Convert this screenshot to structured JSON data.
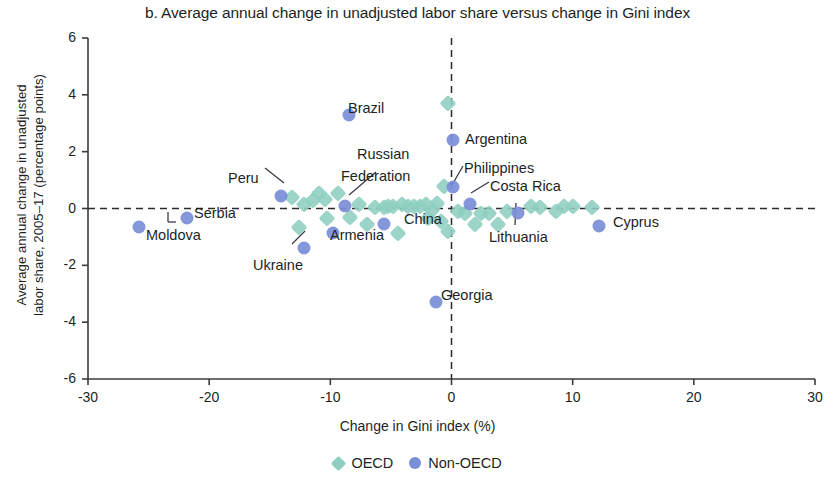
{
  "chart_data": {
    "type": "scatter",
    "title": "b. Average annual change in unadjusted labor share versus change in Gini index",
    "xlabel": "Change in Gini index (%)",
    "ylabel": "Average annual change in unadjusted labor share, 2005–17 (percentage points)",
    "ylabel_line1": "Average annual change in unadjusted",
    "ylabel_line2": "labor share, 2005–17 (percentage points)",
    "xlim": [
      -30,
      30
    ],
    "ylim": [
      -6,
      6
    ],
    "xticks": [
      "-30",
      "-20",
      "-10",
      "0",
      "10",
      "20",
      "30"
    ],
    "xtick_values": [
      -30,
      -20,
      -10,
      0,
      10,
      20,
      30
    ],
    "yticks": [
      "6",
      "4",
      "2",
      "0",
      "-2",
      "-4",
      "-6"
    ],
    "ytick_values": [
      6,
      4,
      2,
      0,
      -2,
      -4,
      -6
    ],
    "grid": false,
    "reference_lines": [
      {
        "axis": "y",
        "value": 0,
        "style": "dashed"
      },
      {
        "axis": "x",
        "value": 0,
        "style": "dashed"
      }
    ],
    "legend_position": "bottom-center",
    "colors": {
      "oecd": "#8ecfc0",
      "non_oecd": "#7b8ed8",
      "axis": "#3b3b3b",
      "text": "#221f1f"
    },
    "series": [
      {
        "name": "OECD",
        "marker": "diamond",
        "color": "#8ecfc0",
        "points": [
          {
            "x": -13.2,
            "y": 0.4
          },
          {
            "x": -12.2,
            "y": 0.15
          },
          {
            "x": -12.6,
            "y": -0.65
          },
          {
            "x": -11.4,
            "y": 0.3
          },
          {
            "x": -10.9,
            "y": 0.55
          },
          {
            "x": -10.4,
            "y": 0.35
          },
          {
            "x": -10.3,
            "y": -0.35
          },
          {
            "x": -9.4,
            "y": 0.55
          },
          {
            "x": -8.4,
            "y": -0.3
          },
          {
            "x": -7.6,
            "y": 0.15
          },
          {
            "x": -7.0,
            "y": -0.55
          },
          {
            "x": -6.3,
            "y": 0.05
          },
          {
            "x": -5.6,
            "y": 0.05
          },
          {
            "x": -5.2,
            "y": 0.1
          },
          {
            "x": -4.8,
            "y": 0.1
          },
          {
            "x": -4.4,
            "y": -0.85
          },
          {
            "x": -4.1,
            "y": 0.15
          },
          {
            "x": -3.6,
            "y": 0.1
          },
          {
            "x": -3.1,
            "y": 0.1
          },
          {
            "x": -2.6,
            "y": 0.1
          },
          {
            "x": -2.1,
            "y": 0.15
          },
          {
            "x": -1.6,
            "y": -0.05
          },
          {
            "x": -1.2,
            "y": 0.2
          },
          {
            "x": -0.9,
            "y": -0.45
          },
          {
            "x": -0.6,
            "y": 0.8
          },
          {
            "x": -0.3,
            "y": 3.7
          },
          {
            "x": -0.3,
            "y": -0.8
          },
          {
            "x": -1.9,
            "y": -0.35
          },
          {
            "x": 0.5,
            "y": -0.1
          },
          {
            "x": 1.1,
            "y": -0.15
          },
          {
            "x": 1.9,
            "y": -0.55
          },
          {
            "x": 2.4,
            "y": -0.15
          },
          {
            "x": 3.1,
            "y": -0.15
          },
          {
            "x": 3.8,
            "y": -0.55
          },
          {
            "x": 4.6,
            "y": -0.1
          },
          {
            "x": 6.6,
            "y": 0.1
          },
          {
            "x": 7.3,
            "y": 0.05
          },
          {
            "x": 8.6,
            "y": -0.1
          },
          {
            "x": 9.3,
            "y": 0.1
          },
          {
            "x": 10.0,
            "y": 0.1
          },
          {
            "x": 11.6,
            "y": 0.05
          }
        ]
      },
      {
        "name": "Non-OECD",
        "marker": "circle",
        "color": "#7b8ed8",
        "points": [
          {
            "x": -25.8,
            "y": -0.65,
            "label": "Moldova"
          },
          {
            "x": -21.8,
            "y": -0.35,
            "label": "Serbia"
          },
          {
            "x": -14.1,
            "y": 0.45,
            "label": "Peru"
          },
          {
            "x": -12.2,
            "y": -1.4,
            "label": "Ukraine"
          },
          {
            "x": -9.8,
            "y": -0.85,
            "label": "Armenia"
          },
          {
            "x": -8.8,
            "y": 0.1,
            "label": "Russian Federation"
          },
          {
            "x": -8.5,
            "y": 3.3,
            "label": "Brazil"
          },
          {
            "x": -5.6,
            "y": -0.55,
            "label": "China"
          },
          {
            "x": -1.3,
            "y": -3.3,
            "label": "Georgia"
          },
          {
            "x": 0.1,
            "y": 2.4,
            "label": "Argentina"
          },
          {
            "x": 0.1,
            "y": 0.75,
            "label": "Philippines"
          },
          {
            "x": 1.5,
            "y": 0.15,
            "label": "Costa Rica"
          },
          {
            "x": 5.5,
            "y": -0.15,
            "label": "Lithuania"
          },
          {
            "x": 12.2,
            "y": -0.6,
            "label": "Cyprus"
          }
        ]
      }
    ],
    "annotations": [
      {
        "text": "Brazil",
        "x": 348,
        "y": 100,
        "anchor": "start"
      },
      {
        "text": "Argentina",
        "x": 465,
        "y": 131,
        "anchor": "start"
      },
      {
        "text": "Russian",
        "x": 357,
        "y": 146,
        "anchor": "start"
      },
      {
        "text": "Federation",
        "x": 341,
        "y": 168,
        "anchor": "start"
      },
      {
        "text": "Philippines",
        "x": 464,
        "y": 160,
        "anchor": "start"
      },
      {
        "text": "Costa Rica",
        "x": 490,
        "y": 178,
        "anchor": "start"
      },
      {
        "text": "Peru",
        "x": 228,
        "y": 170,
        "anchor": "start"
      },
      {
        "text": "Serbia",
        "x": 194,
        "y": 205,
        "anchor": "start"
      },
      {
        "text": "Moldova",
        "x": 146,
        "y": 227,
        "anchor": "start"
      },
      {
        "text": "China",
        "x": 404,
        "y": 211,
        "anchor": "start"
      },
      {
        "text": "Armenia",
        "x": 330,
        "y": 227,
        "anchor": "start"
      },
      {
        "text": "Ukraine",
        "x": 253,
        "y": 257,
        "anchor": "start"
      },
      {
        "text": "Lithuania",
        "x": 489,
        "y": 229,
        "anchor": "start"
      },
      {
        "text": "Cyprus",
        "x": 613,
        "y": 214,
        "anchor": "start"
      },
      {
        "text": "Georgia",
        "x": 441,
        "y": 287,
        "anchor": "start"
      }
    ],
    "leader_lines": [
      {
        "x1": 265,
        "y1": 168,
        "x2": 284,
        "y2": 183
      },
      {
        "x1": 376,
        "y1": 172,
        "x2": 349,
        "y2": 195
      },
      {
        "x1": 463,
        "y1": 166,
        "x2": 452,
        "y2": 185
      },
      {
        "x1": 489,
        "y1": 182,
        "x2": 471,
        "y2": 193
      },
      {
        "x1": 400,
        "y1": 207,
        "x2": 381,
        "y2": 207
      },
      {
        "x1": 515,
        "y1": 225,
        "x2": 516,
        "y2": 203
      },
      {
        "x1": 292,
        "y1": 244,
        "x2": 305,
        "y2": 231
      },
      {
        "x1": 168,
        "y1": 222,
        "x2": 168,
        "y2": 212
      },
      {
        "x1": 168,
        "y1": 222,
        "x2": 176,
        "y2": 222
      }
    ]
  },
  "legend": {
    "items": [
      {
        "label": "OECD",
        "marker": "diamond",
        "color": "#8ecfc0"
      },
      {
        "label": "Non-OECD",
        "marker": "circle",
        "color": "#7b8ed8"
      }
    ]
  }
}
